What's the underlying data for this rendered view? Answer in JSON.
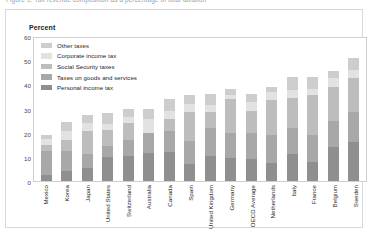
{
  "document": {
    "cut_off_header": "Figure 1. Tax revenue composition as a percentage of total taxation"
  },
  "chart_data": {
    "type": "bar",
    "subtype": "stacked-bar",
    "title": "",
    "ylabel": "Percent",
    "xlabel": "",
    "ylim": [
      0,
      60
    ],
    "yticks": [
      60,
      50,
      40,
      30,
      20,
      10,
      0
    ],
    "grid": false,
    "legend_position": "upper-left-inside",
    "categories": [
      "Mexico",
      "Korea",
      "Japan",
      "United States",
      "Switzerland",
      "Australia",
      "Canada",
      "Spain",
      "United Kingdom",
      "Germany",
      "OECD Average",
      "Netherlands",
      "Italy",
      "France",
      "Belgium",
      "Sweden"
    ],
    "series": [
      {
        "name": "Personal income tax",
        "color": "#8f8f8f",
        "values": [
          2.5,
          4.0,
          5.5,
          10.0,
          10.5,
          11.5,
          12.0,
          7.0,
          10.5,
          9.5,
          9.0,
          7.5,
          11.0,
          8.0,
          14.0,
          16.0
        ]
      },
      {
        "name": "Taxes on goods and services",
        "color": "#a8a8a8",
        "values": [
          10.0,
          8.5,
          5.5,
          4.5,
          6.5,
          8.5,
          8.5,
          9.5,
          11.5,
          10.5,
          11.0,
          11.5,
          11.0,
          11.0,
          11.0,
          12.5
        ]
      },
      {
        "name": "Social Security taxes",
        "color": "#bdbdbd",
        "values": [
          2.5,
          4.5,
          9.5,
          6.5,
          7.0,
          0.0,
          5.0,
          12.0,
          6.5,
          14.0,
          9.0,
          14.5,
          12.5,
          16.5,
          14.0,
          14.0
        ]
      },
      {
        "name": "Corporate income tax",
        "color": "#e2e2e2",
        "values": [
          2.5,
          3.5,
          3.5,
          2.5,
          2.5,
          5.5,
          3.5,
          3.5,
          3.0,
          1.5,
          3.5,
          3.5,
          3.0,
          2.5,
          3.5,
          3.5
        ]
      },
      {
        "name": "Other taxes",
        "color": "#cdcdcd",
        "values": [
          1.5,
          4.0,
          3.5,
          4.5,
          3.5,
          4.5,
          5.0,
          3.5,
          4.5,
          2.5,
          3.5,
          2.0,
          5.5,
          5.0,
          3.0,
          5.0
        ]
      }
    ],
    "totals": [
      19.0,
      24.5,
      27.5,
      28.0,
      30.0,
      30.0,
      34.0,
      35.5,
      36.0,
      38.0,
      36.0,
      39.0,
      43.0,
      43.0,
      45.5,
      51.0
    ]
  }
}
